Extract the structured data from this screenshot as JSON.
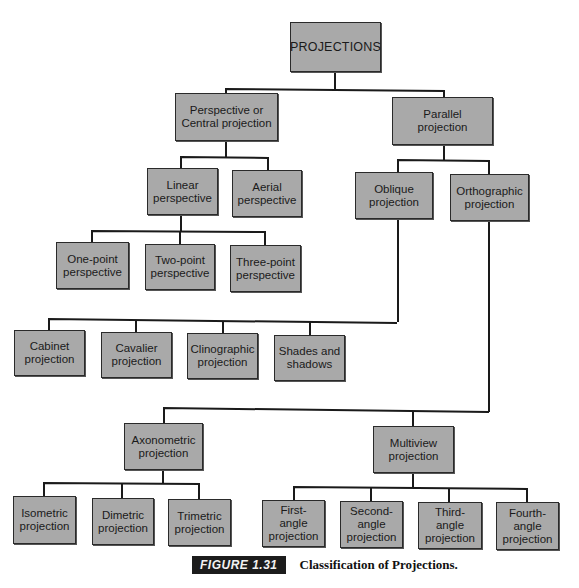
{
  "diagram": {
    "type": "tree",
    "root": {
      "label": "PROJECTIONS",
      "children": [
        {
          "label": "Perspective or\nCentral projection",
          "children": [
            {
              "label": "Linear\nperspective",
              "children": [
                {
                  "label": "One-point\nperspective"
                },
                {
                  "label": "Two-point\nperspective"
                },
                {
                  "label": "Three-point\nperspective"
                }
              ]
            },
            {
              "label": "Aerial\nperspective"
            }
          ]
        },
        {
          "label": "Parallel\nprojection",
          "children": [
            {
              "label": "Oblique\nprojection",
              "children": [
                {
                  "label": "Cabinet\nprojection"
                },
                {
                  "label": "Cavalier\nprojection"
                },
                {
                  "label": "Clinographic\nprojection"
                },
                {
                  "label": "Shades and\nshadows"
                }
              ]
            },
            {
              "label": "Orthographic\nprojection",
              "children": [
                {
                  "label": "Axonometric\nprojection",
                  "children": [
                    {
                      "label": "Isometric\nprojection"
                    },
                    {
                      "label": "Dimetric\nprojection"
                    },
                    {
                      "label": "Trimetric\nprojection"
                    }
                  ]
                },
                {
                  "label": "Multiview\nprojection",
                  "children": [
                    {
                      "label": "First-\nangle\nprojection"
                    },
                    {
                      "label": "Second-\nangle\nprojection"
                    },
                    {
                      "label": "Third-\nangle\nprojection"
                    },
                    {
                      "label": "Fourth-\nangle\nprojection"
                    }
                  ]
                }
              ]
            }
          ]
        }
      ]
    }
  },
  "nodes": {
    "projections": "PROJECTIONS",
    "perspective_central": "Perspective or\nCentral projection",
    "parallel": "Parallel\nprojection",
    "linear_perspective": "Linear\nperspective",
    "aerial_perspective": "Aerial\nperspective",
    "one_point": "One-point\nperspective",
    "two_point": "Two-point\nperspective",
    "three_point": "Three-point\nperspective",
    "oblique": "Oblique\nprojection",
    "orthographic": "Orthographic\nprojection",
    "cabinet": "Cabinet\nprojection",
    "cavalier": "Cavalier\nprojection",
    "clinographic": "Clinographic\nprojection",
    "shades_shadows": "Shades and\nshadows",
    "axonometric": "Axonometric\nprojection",
    "multiview": "Multiview\nprojection",
    "isometric": "Isometric\nprojection",
    "dimetric": "Dimetric\nprojection",
    "trimetric": "Trimetric\nprojection",
    "first_angle": "First-\nangle\nprojection",
    "second_angle": "Second-\nangle\nprojection",
    "third_angle": "Third-\nangle\nprojection",
    "fourth_angle": "Fourth-\nangle\nprojection"
  },
  "caption": {
    "figure_label": "FIGURE 1.31",
    "title": "Classification of Projections."
  },
  "colors": {
    "node_fill": "#a9a9a9",
    "line": "#1a1a1a",
    "label_bg": "#1c1c1c"
  }
}
